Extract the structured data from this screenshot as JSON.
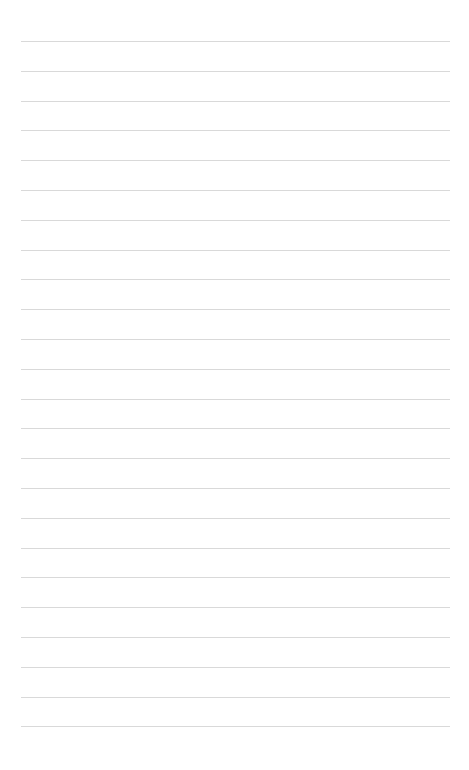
{
  "page": {
    "type": "blank lined notebook page",
    "background_color": "#ffffff",
    "line_color": "#d9d9d9",
    "line_count": 24,
    "first_line_y": 41,
    "line_spacing": 29.8,
    "line_left": 21,
    "line_right": 450,
    "lines": [
      {
        "text": ""
      },
      {
        "text": ""
      },
      {
        "text": ""
      },
      {
        "text": ""
      },
      {
        "text": ""
      },
      {
        "text": ""
      },
      {
        "text": ""
      },
      {
        "text": ""
      },
      {
        "text": ""
      },
      {
        "text": ""
      },
      {
        "text": ""
      },
      {
        "text": ""
      },
      {
        "text": ""
      },
      {
        "text": ""
      },
      {
        "text": ""
      },
      {
        "text": ""
      },
      {
        "text": ""
      },
      {
        "text": ""
      },
      {
        "text": ""
      },
      {
        "text": ""
      },
      {
        "text": ""
      },
      {
        "text": ""
      },
      {
        "text": ""
      },
      {
        "text": ""
      }
    ]
  }
}
